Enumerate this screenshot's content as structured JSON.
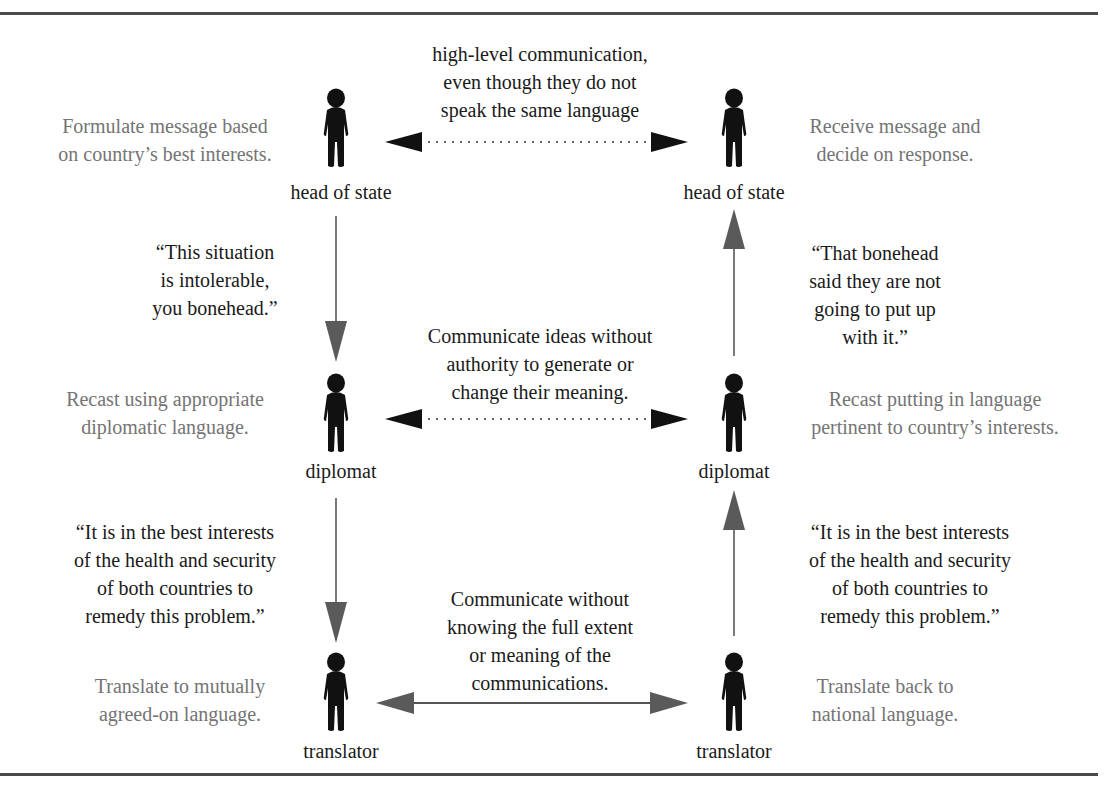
{
  "diagram": {
    "colors": {
      "rule": "#4a4a4a",
      "figure": "#111111",
      "vertical_arrow": "#6b6b6b",
      "dotted_arrow_head": "#111111",
      "solid_arrow": "#5a5a5a",
      "description_text": "#747474",
      "body_text": "#1a1a1a"
    },
    "left_column": {
      "head_of_state": {
        "label": "head of state",
        "description": "Formulate message based\non country’s best interests.",
        "icon": "person-icon"
      },
      "quote_to_diplomat": "“This situation\nis intolerable,\nyou bonehead.”",
      "diplomat": {
        "label": "diplomat",
        "description": "Recast using appropriate\ndiplomatic language.",
        "icon": "person-icon"
      },
      "quote_to_translator": "“It is in the best interests\nof the health and security\nof both countries to\nremedy this problem.”",
      "translator": {
        "label": "translator",
        "description": "Translate to mutually\nagreed-on language.",
        "icon": "person-icon"
      }
    },
    "right_column": {
      "head_of_state": {
        "label": "head of state",
        "description": "Receive message and\ndecide on response.",
        "icon": "person-icon"
      },
      "quote_to_head": "“That bonehead\nsaid they are not\ngoing to put up\nwith it.”",
      "diplomat": {
        "label": "diplomat",
        "description": "Recast putting in language\npertinent to country’s interests.",
        "icon": "person-icon"
      },
      "quote_to_diplomat": "“It is in the best interests\nof the health and security\nof both countries to\nremedy this problem.”",
      "translator": {
        "label": "translator",
        "description": "Translate back to\nnational language.",
        "icon": "person-icon"
      }
    },
    "links": [
      {
        "level": "head_of_state",
        "style": "dotted",
        "direction": "bidirectional",
        "text": "high-level communication,\neven though they do not\nspeak the same language"
      },
      {
        "level": "diplomat",
        "style": "dotted",
        "direction": "bidirectional",
        "text": "Communicate ideas without\nauthority to generate or\nchange their meaning."
      },
      {
        "level": "translator",
        "style": "solid",
        "direction": "bidirectional",
        "text": "Communicate without\nknowing the full extent\nor meaning of the\ncommunications."
      }
    ],
    "vertical_flows": [
      {
        "side": "left",
        "from": "head of state",
        "to": "diplomat",
        "direction": "down"
      },
      {
        "side": "left",
        "from": "diplomat",
        "to": "translator",
        "direction": "down"
      },
      {
        "side": "right",
        "from": "translator",
        "to": "diplomat",
        "direction": "up"
      },
      {
        "side": "right",
        "from": "diplomat",
        "to": "head of state",
        "direction": "up"
      }
    ]
  }
}
